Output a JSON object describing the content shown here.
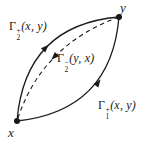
{
  "figure": {
    "background": "#ffffff",
    "ink_color": "#1a1a1a",
    "points": {
      "x": {
        "label": "x"
      },
      "y": {
        "label": "y"
      }
    },
    "curves": {
      "upper_solid": {
        "label": {
          "gamma": "Γ",
          "sub": "2",
          "sup": "+",
          "args": "(x, y)"
        },
        "style": "solid",
        "direction": "x to y"
      },
      "middle_dashed": {
        "label": {
          "gamma": "Γ",
          "sub": "2",
          "sup": "−",
          "args": "(y, x)"
        },
        "style": "dashed",
        "direction": "y to x"
      },
      "lower_solid": {
        "label": {
          "gamma": "Γ",
          "sub": "1",
          "sup": "+",
          "args": "(x, y)"
        },
        "style": "solid",
        "direction": "x to y"
      }
    }
  }
}
